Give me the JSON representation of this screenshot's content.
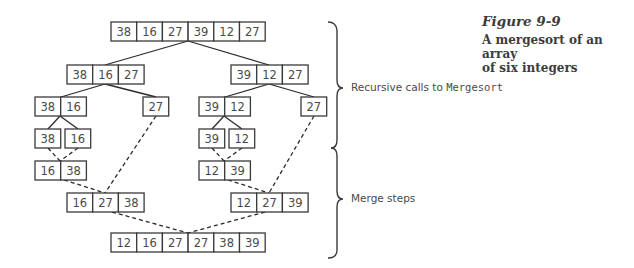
{
  "caption": {
    "figure_number": "Figure 9-9",
    "title_line1": "A mergesort of an array",
    "title_line2": "of six integers"
  },
  "braces": {
    "recursive_label_prefix": "Recursive calls to ",
    "recursive_label_code": "Mergesort",
    "merge_label": "Merge steps"
  },
  "style": {
    "box_stroke": "#3a3a3a",
    "text_color": "#4a4a4a",
    "background": "#ffffff"
  },
  "nodes": [
    {
      "id": "root",
      "x": 111,
      "y": 22,
      "values": [
        "38",
        "16",
        "27",
        "39",
        "12",
        "27"
      ],
      "phase": "split"
    },
    {
      "id": "L",
      "x": 67,
      "y": 65,
      "values": [
        "38",
        "16",
        "27"
      ],
      "phase": "split"
    },
    {
      "id": "R",
      "x": 231,
      "y": 65,
      "values": [
        "39",
        "12",
        "27"
      ],
      "phase": "split"
    },
    {
      "id": "LL",
      "x": 35,
      "y": 97,
      "values": [
        "38",
        "16"
      ],
      "phase": "split"
    },
    {
      "id": "LR",
      "x": 143,
      "y": 97,
      "values": [
        "27"
      ],
      "phase": "split"
    },
    {
      "id": "RL",
      "x": 199,
      "y": 97,
      "values": [
        "39",
        "12"
      ],
      "phase": "split"
    },
    {
      "id": "RR",
      "x": 301,
      "y": 97,
      "values": [
        "27"
      ],
      "phase": "split"
    },
    {
      "id": "LLL",
      "x": 35,
      "y": 129,
      "values": [
        "38"
      ],
      "phase": "split"
    },
    {
      "id": "LLR",
      "x": 65,
      "y": 129,
      "values": [
        "16"
      ],
      "phase": "split"
    },
    {
      "id": "RLL",
      "x": 199,
      "y": 129,
      "values": [
        "39"
      ],
      "phase": "split"
    },
    {
      "id": "RLR",
      "x": 229,
      "y": 129,
      "values": [
        "12"
      ],
      "phase": "split"
    },
    {
      "id": "mLL",
      "x": 35,
      "y": 161,
      "values": [
        "16",
        "38"
      ],
      "phase": "merge"
    },
    {
      "id": "mRL",
      "x": 199,
      "y": 161,
      "values": [
        "12",
        "39"
      ],
      "phase": "merge"
    },
    {
      "id": "mL",
      "x": 67,
      "y": 193,
      "values": [
        "16",
        "27",
        "38"
      ],
      "phase": "merge"
    },
    {
      "id": "mR",
      "x": 231,
      "y": 193,
      "values": [
        "12",
        "27",
        "39"
      ],
      "phase": "merge"
    },
    {
      "id": "final",
      "x": 111,
      "y": 233,
      "values": [
        "12",
        "16",
        "27",
        "27",
        "38",
        "39"
      ],
      "phase": "merge"
    }
  ],
  "edges": [
    {
      "x1": 188,
      "y1": 41,
      "x2": 105,
      "y2": 65,
      "style": "solid"
    },
    {
      "x1": 188,
      "y1": 41,
      "x2": 269,
      "y2": 65,
      "style": "solid"
    },
    {
      "x1": 105,
      "y1": 84,
      "x2": 61,
      "y2": 97,
      "style": "solid"
    },
    {
      "x1": 105,
      "y1": 84,
      "x2": 156,
      "y2": 97,
      "style": "solid"
    },
    {
      "x1": 269,
      "y1": 84,
      "x2": 225,
      "y2": 97,
      "style": "solid"
    },
    {
      "x1": 269,
      "y1": 84,
      "x2": 314,
      "y2": 97,
      "style": "solid"
    },
    {
      "x1": 60,
      "y1": 116,
      "x2": 48,
      "y2": 129,
      "style": "solid"
    },
    {
      "x1": 60,
      "y1": 116,
      "x2": 78,
      "y2": 129,
      "style": "solid"
    },
    {
      "x1": 224,
      "y1": 116,
      "x2": 212,
      "y2": 129,
      "style": "solid"
    },
    {
      "x1": 224,
      "y1": 116,
      "x2": 242,
      "y2": 129,
      "style": "solid"
    },
    {
      "x1": 48,
      "y1": 148,
      "x2": 60,
      "y2": 161,
      "style": "dashed"
    },
    {
      "x1": 78,
      "y1": 148,
      "x2": 60,
      "y2": 161,
      "style": "dashed"
    },
    {
      "x1": 212,
      "y1": 148,
      "x2": 224,
      "y2": 161,
      "style": "dashed"
    },
    {
      "x1": 242,
      "y1": 148,
      "x2": 224,
      "y2": 161,
      "style": "dashed"
    },
    {
      "x1": 156,
      "y1": 116,
      "x2": 105,
      "y2": 193,
      "style": "dashed"
    },
    {
      "x1": 314,
      "y1": 116,
      "x2": 269,
      "y2": 193,
      "style": "dashed"
    },
    {
      "x1": 64,
      "y1": 180,
      "x2": 105,
      "y2": 193,
      "style": "dashed"
    },
    {
      "x1": 228,
      "y1": 180,
      "x2": 269,
      "y2": 193,
      "style": "dashed"
    },
    {
      "x1": 112,
      "y1": 212,
      "x2": 188,
      "y2": 233,
      "style": "dashed"
    },
    {
      "x1": 265,
      "y1": 212,
      "x2": 188,
      "y2": 233,
      "style": "dashed"
    }
  ],
  "layout": {
    "cell_width": 25.7,
    "cell_height": 19
  }
}
